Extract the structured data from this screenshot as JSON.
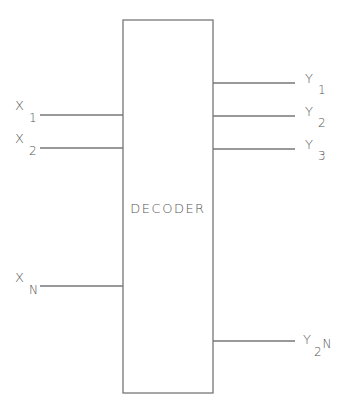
{
  "diagram": {
    "block": {
      "label": "DECODER",
      "x": 123,
      "y": 20,
      "width": 90,
      "height": 373
    },
    "inputs": [
      {
        "name": "X",
        "sub": "1",
        "y": 115
      },
      {
        "name": "X",
        "sub": "2",
        "y": 148
      },
      {
        "name": "X",
        "sub": "N",
        "y": 286
      }
    ],
    "outputs": [
      {
        "name": "Y",
        "sub": "1",
        "y": 83
      },
      {
        "name": "Y",
        "sub": "2",
        "y": 116
      },
      {
        "name": "Y",
        "sub": "3",
        "y": 149
      },
      {
        "name": "Y",
        "sub": "2",
        "sup": "N",
        "y": 341
      }
    ],
    "colors": {
      "stroke": "#777777",
      "text": "#555555"
    }
  }
}
